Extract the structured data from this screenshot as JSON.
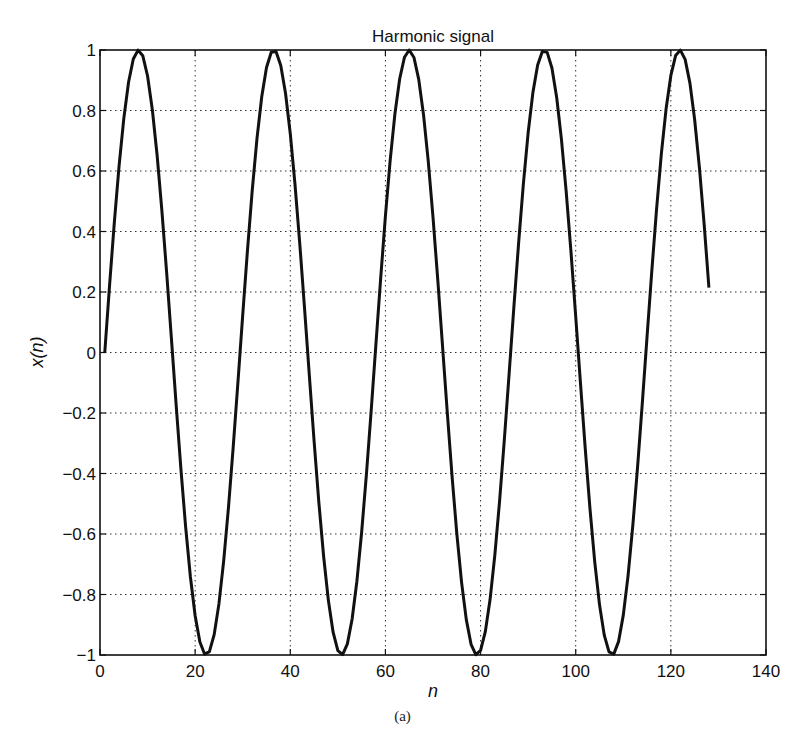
{
  "chart_data": {
    "type": "line",
    "title": "Harmonic signal",
    "xlabel": "n",
    "ylabel": "x(n)",
    "xlim": [
      0,
      140
    ],
    "ylim": [
      -1,
      1
    ],
    "xticks": [
      0,
      20,
      40,
      60,
      80,
      100,
      120,
      140
    ],
    "xtick_labels": [
      "0",
      "20",
      "40",
      "60",
      "80",
      "100",
      "120",
      "140"
    ],
    "yticks": [
      -1,
      -0.8,
      -0.6,
      -0.4,
      -0.2,
      0,
      0.2,
      0.4,
      0.6,
      0.8,
      1
    ],
    "ytick_labels": [
      "−1",
      "−0.8",
      "−0.6",
      "−0.4",
      "−0.2",
      "0",
      "0.2",
      "0.4",
      "0.6",
      "0.8",
      "1"
    ],
    "grid": true,
    "grid_style": "dotted",
    "legend": null,
    "series": [
      {
        "name": "x(n)",
        "formula": "sin(2*pi*(n-1)/28.44)",
        "n_start": 1,
        "n_end": 128,
        "period": 28.44,
        "color": "#111111",
        "line_width": 3,
        "peaks_n": [
          8,
          36.5,
          65,
          93.5,
          122
        ],
        "troughs_n": [
          22,
          51,
          79,
          108
        ],
        "start_value": 0,
        "end_value": 0.22
      }
    ]
  },
  "caption": "(a)"
}
